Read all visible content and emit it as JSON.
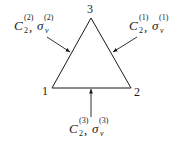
{
  "diagram": {
    "type": "symmetry-elements-equilateral-triangle",
    "vertices": [
      {
        "id": "1",
        "label": "1"
      },
      {
        "id": "2",
        "label": "2"
      },
      {
        "id": "3",
        "label": "3"
      }
    ],
    "symmetry_labels": [
      {
        "id": "top-left",
        "axis": "C",
        "axis_sub": "2",
        "axis_sup": "(2)",
        "plane": "σ",
        "plane_sub": "v",
        "plane_sup": "(2)",
        "separator": ","
      },
      {
        "id": "top-right",
        "axis": "C",
        "axis_sub": "2",
        "axis_sup": "(1)",
        "plane": "σ",
        "plane_sub": "v",
        "plane_sup": "(1)",
        "separator": ","
      },
      {
        "id": "bottom",
        "axis": "C",
        "axis_sub": "2",
        "axis_sup": "(3)",
        "plane": "σ",
        "plane_sub": "v",
        "plane_sup": "(3)",
        "separator": ","
      }
    ],
    "colors": {
      "stroke": "#1a1a1a",
      "background": "#ffffff"
    }
  }
}
